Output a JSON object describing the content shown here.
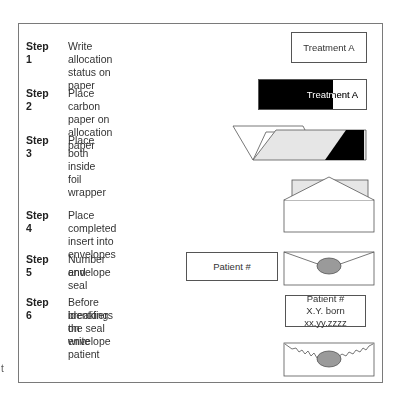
{
  "steps": [
    {
      "label": "Step 1",
      "text": "Write allocation status on paper"
    },
    {
      "label": "Step 2",
      "text": "Place carbon paper on allocation paper"
    },
    {
      "label": "Step 3",
      "text": "Place both inside foil wrapper"
    },
    {
      "label": "Step 4",
      "text": "Place completed insert into envelopes"
    },
    {
      "label": "Step 5",
      "text_line1": "Number and seal",
      "text_line2": "envelope"
    },
    {
      "label": "Step 6",
      "text_line1": "Before breaking the seal write patient",
      "text_line2": "identifiers on envelope"
    }
  ],
  "boxes": {
    "treatment1": "Treatment A",
    "treatment2": "Treatment A",
    "patient_number": "Patient #",
    "patient_id_line1": "Patient #",
    "patient_id_line2": "X.Y. born xx.yy.zzzz"
  },
  "stray_text": "t",
  "colors": {
    "carbon": "#000000",
    "foil": "#e6e6e6",
    "seal": "#9a9a9a",
    "border": "#555555"
  }
}
